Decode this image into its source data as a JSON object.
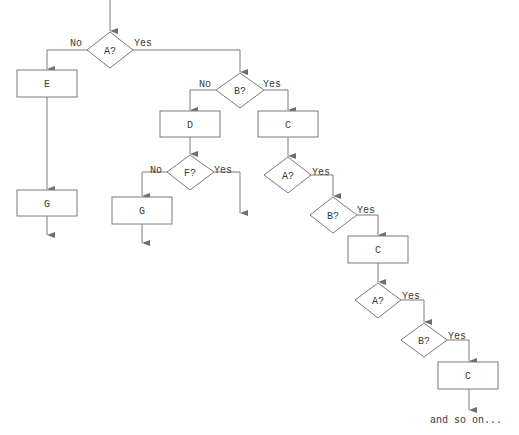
{
  "diagram": {
    "type": "flowchart",
    "colors": {
      "line": "#7a7a7a",
      "text": "#3a3a3a",
      "background": "#ffffff"
    },
    "nodes": {
      "a1": {
        "shape": "diamond",
        "label": "A?"
      },
      "e": {
        "shape": "box",
        "label": "E"
      },
      "g1": {
        "shape": "box",
        "label": "G"
      },
      "b1": {
        "shape": "diamond",
        "label": "B?"
      },
      "d": {
        "shape": "box",
        "label": "D"
      },
      "c1": {
        "shape": "box",
        "label": "C"
      },
      "f": {
        "shape": "diamond",
        "label": "F?"
      },
      "g2": {
        "shape": "box",
        "label": "G"
      },
      "a2": {
        "shape": "diamond",
        "label": "A?"
      },
      "b2": {
        "shape": "diamond",
        "label": "B?"
      },
      "c2": {
        "shape": "box",
        "label": "C"
      },
      "a3": {
        "shape": "diamond",
        "label": "A?"
      },
      "b3": {
        "shape": "diamond",
        "label": "B?"
      },
      "c3": {
        "shape": "box",
        "label": "C"
      }
    },
    "edge_labels": {
      "a1_no": "No",
      "a1_yes": "Yes",
      "b1_no": "No",
      "b1_yes": "Yes",
      "f_no": "No",
      "f_yes": "Yes",
      "a2_yes": "Yes",
      "b2_yes": "Yes",
      "a3_yes": "Yes",
      "b3_yes": "Yes"
    },
    "edges": [
      {
        "from": "start",
        "to": "a1"
      },
      {
        "from": "a1",
        "to": "e",
        "label": "No"
      },
      {
        "from": "a1",
        "to": "b1",
        "label": "Yes"
      },
      {
        "from": "e",
        "to": "g1"
      },
      {
        "from": "g1",
        "to": "end"
      },
      {
        "from": "b1",
        "to": "d",
        "label": "No"
      },
      {
        "from": "b1",
        "to": "c1",
        "label": "Yes"
      },
      {
        "from": "d",
        "to": "f"
      },
      {
        "from": "f",
        "to": "g2",
        "label": "No"
      },
      {
        "from": "f",
        "to": "end",
        "label": "Yes"
      },
      {
        "from": "g2",
        "to": "end"
      },
      {
        "from": "c1",
        "to": "a2"
      },
      {
        "from": "a2",
        "to": "b2",
        "label": "Yes"
      },
      {
        "from": "b2",
        "to": "c2",
        "label": "Yes"
      },
      {
        "from": "c2",
        "to": "a3"
      },
      {
        "from": "a3",
        "to": "b3",
        "label": "Yes"
      },
      {
        "from": "b3",
        "to": "c3",
        "label": "Yes"
      },
      {
        "from": "c3",
        "to": "continuation"
      }
    ],
    "continuation_text": "and so on..."
  }
}
